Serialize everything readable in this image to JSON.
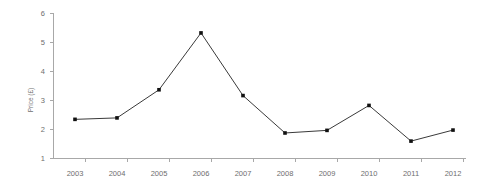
{
  "chart_data": {
    "type": "line",
    "title": "",
    "xlabel": "",
    "ylabel": "Price (£)",
    "categories": [
      "2003",
      "2004",
      "2005",
      "2006",
      "2007",
      "2008",
      "2009",
      "2010",
      "2011",
      "2012"
    ],
    "values": [
      2.35,
      2.4,
      3.37,
      5.33,
      3.17,
      1.88,
      1.97,
      2.83,
      1.6,
      1.98
    ],
    "series": [
      {
        "name": "Price",
        "values": [
          2.35,
          2.4,
          3.37,
          5.33,
          3.17,
          1.88,
          1.97,
          2.83,
          1.6,
          1.98
        ]
      }
    ],
    "ylim": [
      1,
      6
    ],
    "y_ticks": [
      1,
      2,
      3,
      4,
      5,
      6
    ],
    "y_tick_labels": [
      "1",
      "2",
      "3",
      "4",
      "5",
      "6"
    ],
    "x_tick_labels": [
      "2003",
      "2004",
      "2005",
      "2006",
      "2007",
      "2008",
      "2009",
      "2010",
      "2011",
      "2012"
    ],
    "grid": false,
    "legend": false,
    "legend_position": "none",
    "marker": "square",
    "line_color": "#3a3a3a",
    "marker_color": "#111111",
    "axis_color": "#a8a8a8",
    "text_color": "#6e6e6e",
    "background_color": "#ffffff"
  }
}
